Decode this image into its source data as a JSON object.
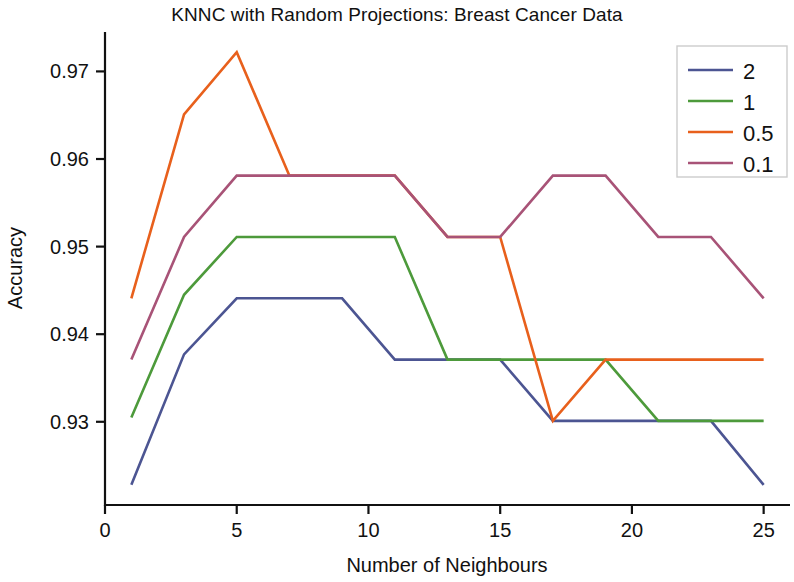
{
  "chart_data": {
    "type": "line",
    "title": "KNNC with Random Projections: Breast Cancer Data",
    "xlabel": "Number of Neighbours",
    "ylabel": "Accuracy",
    "xlim": [
      0,
      26
    ],
    "ylim": [
      0.9205,
      0.9745
    ],
    "grid": false,
    "legend_position": "upper right",
    "legend_title": "",
    "xticks": [
      0,
      5,
      10,
      15,
      20,
      25
    ],
    "xtick_labels": [
      "0",
      "5",
      "10",
      "15",
      "20",
      "25"
    ],
    "yticks": [
      0.93,
      0.94,
      0.95,
      0.96,
      0.97
    ],
    "ytick_labels": [
      "0.93",
      "0.94",
      "0.95",
      "0.96",
      "0.97"
    ],
    "x": [
      1,
      3,
      5,
      7,
      9,
      11,
      13,
      15,
      17,
      19,
      21,
      23,
      25
    ],
    "series": [
      {
        "name": "2",
        "color": "#4c5592",
        "values": [
          0.9228,
          0.9377,
          0.9441,
          0.9441,
          0.9441,
          0.9371,
          0.9371,
          0.9371,
          0.9301,
          0.9301,
          0.9301,
          0.9301,
          0.9228
        ]
      },
      {
        "name": "1",
        "color": "#4d9a3b",
        "values": [
          0.9305,
          0.9445,
          0.9511,
          0.9511,
          0.9511,
          0.9511,
          0.9371,
          0.9371,
          0.9371,
          0.9371,
          0.9301,
          0.9301,
          0.9301
        ]
      },
      {
        "name": "0.5",
        "color": "#e8601c",
        "values": [
          0.9441,
          0.9651,
          0.9722,
          0.9581,
          0.9581,
          0.9581,
          0.9511,
          0.9511,
          0.9301,
          0.9371,
          0.9371,
          0.9371,
          0.9371
        ]
      },
      {
        "name": "0.1",
        "color": "#a85377",
        "values": [
          0.9371,
          0.9511,
          0.9581,
          0.9581,
          0.9581,
          0.9581,
          0.9511,
          0.9511,
          0.9581,
          0.9581,
          0.9511,
          0.9511,
          0.9441
        ]
      }
    ]
  },
  "legend": {
    "entries": [
      {
        "label": "2",
        "color": "#4c5592"
      },
      {
        "label": "1",
        "color": "#4d9a3b"
      },
      {
        "label": "0.5",
        "color": "#e8601c"
      },
      {
        "label": "0.1",
        "color": "#a85377"
      }
    ]
  }
}
